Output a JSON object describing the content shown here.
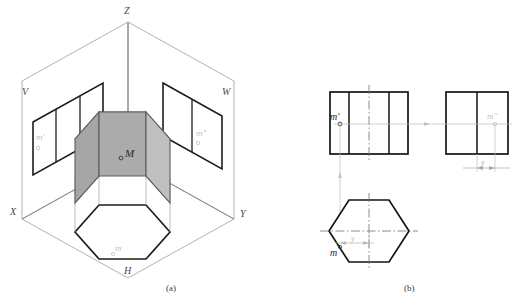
{
  "figure": {
    "captions": {
      "a": "(a)",
      "b": "(b)"
    }
  },
  "pictorial": {
    "name": "three-plane-projection-pictorial",
    "axis_labels": {
      "z": "Z",
      "x": "X",
      "y": "Y"
    },
    "plane_labels": {
      "v": "V",
      "w": "W",
      "h": "H"
    },
    "point_labels": {
      "space_point": "M",
      "v_projection": "m'",
      "w_projection": "m″",
      "h_projection": "m"
    },
    "colors": {
      "plane_outline": "#9a9a9a",
      "prism_top": "#dcdcdc",
      "prism_side_left": "#a8a8a8",
      "prism_side_right": "#bdbdbd",
      "prism_edge": "#4a4a4a",
      "projection_outline": "#1a1a1a",
      "faint_label": "#b4b4b4"
    }
  },
  "orthographic": {
    "name": "three-view-orthographic-drawing",
    "views": {
      "front": {
        "label": "front-view",
        "point_label": "m'",
        "description": "rectangle with two internal vertical edges and vertical centerline"
      },
      "side": {
        "label": "side-view",
        "point_label": "m″",
        "description": "rectangle with one central vertical edge"
      },
      "top": {
        "label": "top-view",
        "point_label": "m",
        "description": "regular hexagon with flat top and bottom edges"
      }
    },
    "dimensions": {
      "side_y": "y",
      "top_y": "y"
    },
    "colors": {
      "outline": "#151515",
      "centerline": "#777777",
      "projection_line": "#b0b0b0",
      "dimension": "#9a9a9a",
      "faint_label": "#bcbcbc"
    }
  }
}
